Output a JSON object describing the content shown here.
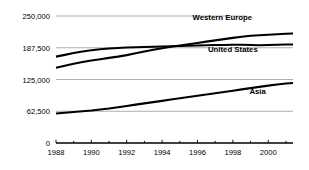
{
  "chart_data": {
    "type": "line",
    "title": "",
    "subtitle": "",
    "xlabel": "",
    "ylabel": "",
    "grid": "horizontal",
    "legend_position": "inline-right",
    "xlim": [
      1988,
      2001.4
    ],
    "ylim": [
      0,
      250000
    ],
    "ytick_labels": [
      "250,000",
      "187,500",
      "125,000",
      "62,500",
      "0"
    ],
    "ytick_values": [
      250000,
      187500,
      125000,
      62500,
      0
    ],
    "xtick_labels": [
      "1988",
      "1990",
      "1992",
      "1994",
      "1996",
      "1998",
      "2000"
    ],
    "xtick_values": [
      1988,
      1990,
      1992,
      1994,
      1996,
      1998,
      2000
    ],
    "x": [
      1988,
      1988.5,
      1989,
      1989.5,
      1990,
      1990.5,
      1991,
      1991.5,
      1992,
      1992.5,
      1993,
      1993.5,
      1994,
      1994.5,
      1995,
      1995.5,
      1996,
      1996.5,
      1997,
      1997.5,
      1998,
      1998.5,
      1999,
      1999.5,
      2000,
      2000.5,
      2001,
      2001.4
    ],
    "series": [
      {
        "name": "Western Europe",
        "label": "Western Europe",
        "color": "#000000",
        "values": [
          170000,
          173500,
          177000,
          180000,
          182500,
          184500,
          186000,
          187000,
          188000,
          188500,
          189000,
          189500,
          190000,
          190500,
          191000,
          191500,
          192000,
          192500,
          193000,
          193000,
          193500,
          193500,
          193000,
          192500,
          193000,
          193500,
          194000,
          194000
        ]
      },
      {
        "name": "United States",
        "label": "United States",
        "color": "#000000",
        "values": [
          148000,
          152000,
          156000,
          159500,
          162500,
          165000,
          167500,
          170000,
          173000,
          176500,
          180000,
          183500,
          186500,
          189500,
          192000,
          194500,
          197000,
          199500,
          202000,
          204500,
          207000,
          209000,
          211000,
          212000,
          213000,
          214000,
          215000,
          215500
        ]
      },
      {
        "name": "Asia",
        "label": "Asia",
        "color": "#000000",
        "values": [
          58000,
          59500,
          61000,
          62500,
          64000,
          66000,
          68000,
          70500,
          73000,
          75500,
          78000,
          80500,
          83000,
          85500,
          88000,
          90500,
          93000,
          95500,
          98000,
          100500,
          103000,
          105500,
          108000,
          110500,
          113000,
          115000,
          117000,
          118000
        ]
      }
    ],
    "series_label_positions": [
      {
        "name": "Western Europe",
        "x": 1997.4,
        "y": 243000
      },
      {
        "name": "United States",
        "x": 1998.0,
        "y": 180000
      },
      {
        "name": "Asia",
        "x": 1999.4,
        "y": 96000
      }
    ]
  }
}
